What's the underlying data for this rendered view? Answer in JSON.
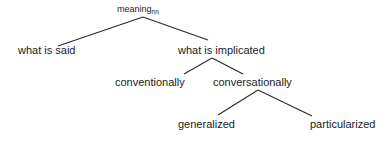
{
  "diagram": {
    "type": "tree",
    "root": {
      "label": "meaning",
      "subscript": "nn"
    },
    "nodes": [
      {
        "id": "root",
        "label": "meaning",
        "subscript": "nn",
        "parent": null
      },
      {
        "id": "said",
        "label": "what is said",
        "parent": "root"
      },
      {
        "id": "implicated",
        "label": "what is implicated",
        "parent": "root"
      },
      {
        "id": "conventionally",
        "label": "conventionally",
        "parent": "implicated"
      },
      {
        "id": "conversationally",
        "label": "conversationally",
        "parent": "implicated"
      },
      {
        "id": "generalized",
        "label": "generalized",
        "parent": "conversationally"
      },
      {
        "id": "particularized",
        "label": "particularized",
        "parent": "conversationally"
      }
    ],
    "labels": {
      "root": "meaning",
      "root_sub": "nn",
      "said": "what is said",
      "implicated": "what is implicated",
      "conventionally": "conventionally",
      "conversationally": "conversationally",
      "generalized": "generalized",
      "particularized": "particularized"
    },
    "colors": {
      "line": "#2a2a2a",
      "text": "#1c1c1c",
      "background": "#ffffff"
    }
  }
}
